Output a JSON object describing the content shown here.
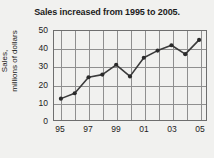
{
  "chart_data": {
    "type": "line",
    "title": "Sales increased from 1995 to 2005.",
    "xlabel": "",
    "ylabel": "Sales, millions of dollars",
    "ylabel_line1": "Sales,",
    "ylabel_line2": "millions of dollars",
    "x": [
      1995,
      1996,
      1997,
      1998,
      1999,
      2000,
      2001,
      2002,
      2003,
      2004,
      2005
    ],
    "values": [
      12,
      15,
      24,
      25.5,
      31,
      24.5,
      35,
      39,
      42,
      37,
      45
    ],
    "categories": [
      "95",
      "96",
      "97",
      "98",
      "99",
      "00",
      "01",
      "02",
      "03",
      "04",
      "05"
    ],
    "xtick_labels": [
      "95",
      "97",
      "99",
      "01",
      "03",
      "05"
    ],
    "xtick_values": [
      1995,
      1997,
      1999,
      2001,
      2003,
      2005
    ],
    "ytick_labels": [
      "0",
      "10",
      "20",
      "30",
      "40",
      "50"
    ],
    "ytick_values": [
      0,
      10,
      20,
      30,
      40,
      50
    ],
    "xlim": [
      1994.5,
      2005.5
    ],
    "ylim": [
      0,
      50
    ],
    "grid": true,
    "legend": "none",
    "marker": "circle",
    "line_color": "#3b3b3b",
    "marker_color": "#2a2a2a",
    "grid_color": "#8f8f8f",
    "frame_color": "#6e6e6e",
    "background_color": "#f1f1ef",
    "text_color": "#1c1c1c"
  }
}
